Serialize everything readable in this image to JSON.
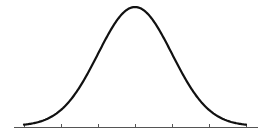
{
  "chart_data": {
    "type": "line",
    "title": "",
    "xlabel": "",
    "ylabel": "",
    "mean": 0,
    "std": 1,
    "x_ticks": [
      -3,
      -2,
      -1,
      0,
      1,
      2,
      3
    ],
    "x_tick_labels": [],
    "xlim": [
      -3.3,
      3.3
    ],
    "grid": false,
    "legend": null,
    "series": [
      {
        "name": "normal-pdf",
        "x": [
          -3,
          -2.5,
          -2,
          -1.5,
          -1,
          -0.5,
          0,
          0.5,
          1,
          1.5,
          2,
          2.5,
          3
        ],
        "values": [
          0.0044,
          0.0175,
          0.054,
          0.1295,
          0.242,
          0.3521,
          0.3989,
          0.3521,
          0.242,
          0.1295,
          0.054,
          0.0175,
          0.0044
        ]
      }
    ],
    "colors": {
      "curve": "#111111",
      "axis": "#555555",
      "background": "#ffffff"
    }
  },
  "layout": {
    "axis_y": 127,
    "axis_x_start": 14,
    "axis_x_end": 258,
    "center_x": 135,
    "sigma_px": 37,
    "peak_y": 7
  }
}
